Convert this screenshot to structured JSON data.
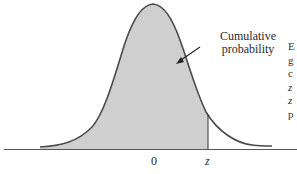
{
  "diagram": {
    "type": "standard-normal-curve",
    "shaded_region": "left of z",
    "callout": {
      "line1": "Cumulative",
      "line2": "probability"
    },
    "axis_labels": {
      "center": "0",
      "z": "z"
    },
    "cropped_side_text": [
      "E",
      "g",
      "c",
      "z",
      "z",
      "p"
    ],
    "colors": {
      "curve": "#4a4a4a",
      "shade": "#cfcfcf",
      "axis": "#555555",
      "text": "#2a2a2a"
    }
  }
}
